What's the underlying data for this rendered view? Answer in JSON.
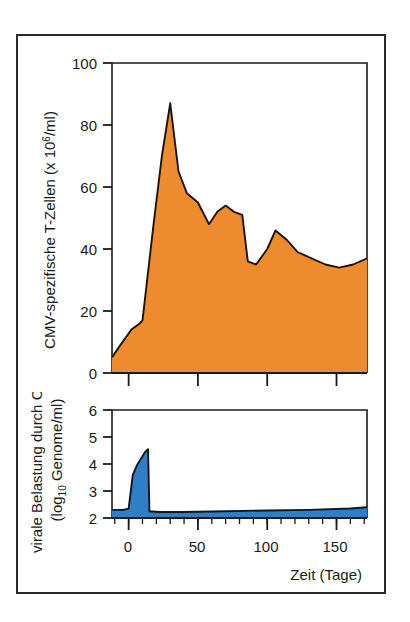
{
  "figure": {
    "background_color": "#ffffff",
    "frame_color": "#2b2b2b",
    "axis_color": "#1a1a1a"
  },
  "chart_data": [
    {
      "type": "area",
      "id": "cmv-specific-t-cells",
      "title": "",
      "xlabel": "",
      "ylabel": "CMV-spezifische T-Zellen (x 10⁶/ml)",
      "ylabel_parts": {
        "main": "CMV-spezifische T-Zellen (x 10",
        "superscript": "6",
        "tail": "/ml)"
      },
      "fill_color": "#ED8B2E",
      "line_color": "#151515",
      "grid": false,
      "legend": false,
      "xlim": [
        -12,
        172
      ],
      "ylim": [
        0,
        100
      ],
      "yticks": [
        0,
        20,
        40,
        60,
        80,
        100
      ],
      "ytick_labels": [
        "0",
        "20",
        "40",
        "60",
        "80",
        "100"
      ],
      "xticks": [
        0,
        50,
        100,
        150
      ],
      "xtick_labels": [
        "",
        "",
        "",
        ""
      ],
      "x": [
        -12,
        -6,
        2,
        8,
        10,
        18,
        24,
        30,
        36,
        42,
        50,
        58,
        64,
        70,
        76,
        82,
        86,
        92,
        100,
        106,
        114,
        122,
        132,
        142,
        152,
        162,
        172
      ],
      "values": [
        5,
        9,
        14,
        16,
        17,
        48,
        70,
        87,
        65,
        58,
        55,
        48,
        52,
        54,
        52,
        51,
        36,
        35,
        40,
        46,
        43,
        39,
        37,
        35,
        34,
        35,
        37
      ]
    },
    {
      "type": "area",
      "id": "cmv-viral-load",
      "title": "",
      "xlabel": "Zeit (Tage)",
      "ylabel": "virale Belastung durch CMV (log₁₀ Genome/ml)",
      "ylabel_parts": {
        "line1": "virale Belastung durch CMV",
        "line2_pre": "(log",
        "line2_sub": "10",
        "line2_post": " Genome/ml)"
      },
      "fill_color": "#2E7FC6",
      "line_color": "#151515",
      "grid": false,
      "legend": false,
      "xlim": [
        -12,
        172
      ],
      "ylim": [
        2,
        6
      ],
      "yticks": [
        2,
        3,
        4,
        5,
        6
      ],
      "ytick_labels": [
        "2",
        "3",
        "4",
        "5",
        "6"
      ],
      "xticks": [
        0,
        50,
        100,
        150
      ],
      "xtick_labels": [
        "0",
        "50",
        "100",
        "150"
      ],
      "xminor_step": 10,
      "x": [
        -12,
        -4,
        0,
        3,
        6,
        9,
        12,
        14,
        15,
        22,
        40,
        70,
        100,
        130,
        160,
        172
      ],
      "values": [
        2.3,
        2.3,
        2.35,
        3.6,
        3.95,
        4.2,
        4.45,
        4.55,
        2.25,
        2.22,
        2.22,
        2.25,
        2.28,
        2.3,
        2.35,
        2.4
      ]
    }
  ]
}
